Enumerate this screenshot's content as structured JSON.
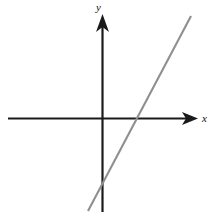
{
  "figure": {
    "title": "",
    "background_color": "#ffffff",
    "width": 214,
    "height": 219
  },
  "axes": {
    "x_label": "x",
    "y_label": "y",
    "axis_color": "#1a1a1a",
    "origin_px": {
      "x": 102,
      "y": 118
    },
    "x_axis_px": {
      "x1": 8,
      "y1": 118,
      "x2": 197,
      "y2": 118
    },
    "y_axis_px": {
      "x1": 102,
      "y1": 16,
      "x2": 102,
      "y2": 212
    },
    "x_arrow": "arrow-right",
    "y_arrow": "arrow-up"
  },
  "chart_data": {
    "type": "line",
    "title": "",
    "xlabel": "x",
    "ylabel": "y",
    "grid": false,
    "legend": null,
    "xlim": [
      -5,
      5
    ],
    "ylim": [
      -5,
      5
    ],
    "series": [
      {
        "name": "line",
        "color": "#8f8f8f",
        "slope": 1.89,
        "x_intercept": 1.0,
        "y_intercept": -1.9,
        "x": [
          -0.75,
          2.45
        ],
        "y": [
          -3.3,
          2.7
        ],
        "pixel_endpoints": [
          {
            "x": 88,
            "y": 211
          },
          {
            "x": 191,
            "y": 16
          }
        ],
        "pixel_x_intercept": {
          "x": 137,
          "y": 118
        },
        "pixel_y_intercept": {
          "x": 102,
          "y": 186
        }
      }
    ]
  }
}
